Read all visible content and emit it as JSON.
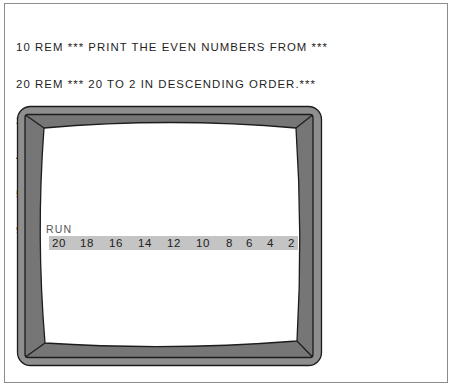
{
  "program": {
    "lines": [
      {
        "number": "10",
        "code": "REM *** PRINT THE EVEN NUMBERS FROM ***"
      },
      {
        "number": "20",
        "code": "REM *** 20 TO 2 IN DESCENDING ORDER.***"
      },
      {
        "number": "30",
        "code": "FOR EVEN = 20 TO 2 STEP -2"
      },
      {
        "number": "40",
        "code": "  PRINT EVEN;"
      },
      {
        "number": "50",
        "code": "NEXT EVEN"
      },
      {
        "number": "99",
        "code": "END"
      }
    ]
  },
  "screen": {
    "command": "RUN",
    "output": [
      "20",
      "18",
      "16",
      "14",
      "12",
      "10",
      "8",
      "6",
      "4",
      "2"
    ]
  },
  "colors": {
    "bezel_outer": "#8e8e8e",
    "bezel_inner": "#767676",
    "bezel_line": "#1c1c1c",
    "screen": "#ffffff",
    "output_highlight": "#c4c4c4",
    "text": "#1e1e1e"
  }
}
